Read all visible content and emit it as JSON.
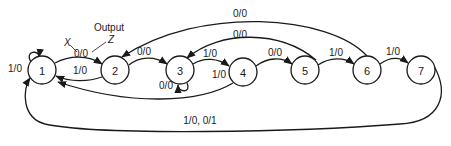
{
  "diagram": {
    "type": "state-transition-diagram",
    "annotation": {
      "output_label": "Output",
      "input_symbol": "X",
      "output_symbol": "Z"
    },
    "states": [
      {
        "id": "1",
        "label": "1"
      },
      {
        "id": "2",
        "label": "2"
      },
      {
        "id": "3",
        "label": "3"
      },
      {
        "id": "4",
        "label": "4"
      },
      {
        "id": "5",
        "label": "5"
      },
      {
        "id": "6",
        "label": "6"
      },
      {
        "id": "7",
        "label": "7"
      }
    ],
    "transitions": [
      {
        "from": "1",
        "to": "1",
        "label": "1/0"
      },
      {
        "from": "1",
        "to": "2",
        "label": "0/0"
      },
      {
        "from": "2",
        "to": "1",
        "label": "1/0"
      },
      {
        "from": "2",
        "to": "3",
        "label": "0/0"
      },
      {
        "from": "3",
        "to": "3",
        "label": "0/0"
      },
      {
        "from": "3",
        "to": "4",
        "label": "1/0"
      },
      {
        "from": "4",
        "to": "1",
        "label": "1/0"
      },
      {
        "from": "4",
        "to": "5",
        "label": "0/0"
      },
      {
        "from": "5",
        "to": "3",
        "label": "0/0"
      },
      {
        "from": "5",
        "to": "6",
        "label": "1/0"
      },
      {
        "from": "6",
        "to": "2",
        "label": "0/0"
      },
      {
        "from": "6",
        "to": "7",
        "label": "1/0"
      },
      {
        "from": "7",
        "to": "1",
        "label": "1/0, 0/1"
      }
    ]
  }
}
